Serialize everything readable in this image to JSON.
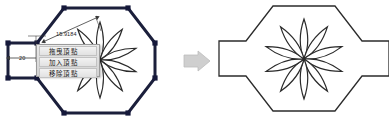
{
  "document": {
    "title": "Vertex editing of an octagonal shape with flower rosette",
    "background_color": "#ffffff"
  },
  "colors": {
    "shape_stroke_selected": "#1b1f3b",
    "shape_stroke_plain": "#2b2b2b",
    "vertex_handle_fill": "#15183a",
    "flower_stroke": "#2a2a2a",
    "menu_background": "#dcdcdc",
    "menu_border": "#9a9a9a",
    "menu_text": "#1a1a1a",
    "dimension_line": "#3a3a3a",
    "dimension_text": "#222222",
    "arrow_fill": "#cfcfcf",
    "arrow_stroke": "#bdbdbd"
  },
  "left_figure": {
    "name": "selected-octagon-with-flower",
    "selected": true,
    "outline_points": "64,8 128,8 155,43 155,78 128,113 64,113 37,78 8,78 8,43 37,43",
    "vertex_handles": [
      {
        "x": 64,
        "y": 8
      },
      {
        "x": 128,
        "y": 8
      },
      {
        "x": 155,
        "y": 43
      },
      {
        "x": 155,
        "y": 78
      },
      {
        "x": 128,
        "y": 113
      },
      {
        "x": 64,
        "y": 113
      },
      {
        "x": 37,
        "y": 78
      },
      {
        "x": 8,
        "y": 78
      },
      {
        "x": 8,
        "y": 43
      },
      {
        "x": 37,
        "y": 43
      }
    ],
    "flower": {
      "center_x": 100,
      "center_y": 60,
      "petal_count": 10,
      "petal_length": 38,
      "petal_width": 14
    }
  },
  "dimensions": [
    {
      "id": "diagonal",
      "value": "15.9184",
      "label_x": 56,
      "label_y": 31
    },
    {
      "id": "width",
      "value": "20",
      "label_x": 19,
      "label_y": 55
    }
  ],
  "context_menu": {
    "name": "vertex-context-menu",
    "visible": true,
    "x": 36,
    "y": 44,
    "width": 64,
    "height": 33,
    "items": [
      {
        "id": "drag-vertex",
        "label": "拖曳頂點"
      },
      {
        "id": "add-vertex",
        "label": "加入頂點"
      },
      {
        "id": "remove-vertex",
        "label": "移除頂點"
      }
    ]
  },
  "transition_arrow": {
    "name": "right-arrow-icon",
    "direction": "right",
    "x": 184,
    "y": 51,
    "width": 26,
    "height": 20
  },
  "right_figure": {
    "name": "result-octagon-with-flower",
    "selected": false,
    "outline_points": "273,6 335,6 362,41 389,41 389,76 362,76 335,111 273,111 246,76 219,76 219,41 246,41",
    "flower": {
      "center_x": 304,
      "center_y": 59,
      "petal_count": 10,
      "petal_length": 40,
      "petal_width": 15
    }
  }
}
